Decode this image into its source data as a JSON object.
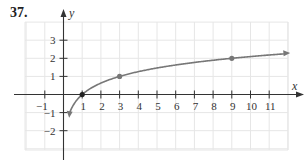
{
  "problem_number": "37.",
  "chart_data": {
    "type": "line",
    "title": "",
    "function_description": "y = log base 3 of x",
    "xlabel": "x",
    "ylabel": "y",
    "xlim": [
      -2,
      12
    ],
    "ylim": [
      -3,
      4
    ],
    "x_ticks": [
      -1,
      1,
      2,
      3,
      4,
      5,
      6,
      7,
      8,
      9,
      10,
      11
    ],
    "x_tick_labels": [
      "−1",
      "1",
      "2",
      "3",
      "4",
      "5",
      "6",
      "7",
      "8",
      "9",
      "10",
      "11"
    ],
    "y_ticks": [
      3,
      2,
      1,
      -1,
      -2
    ],
    "y_tick_labels": [
      "3",
      "2",
      "1",
      "−1",
      "−2"
    ],
    "grid": true,
    "legend": null,
    "series": [
      {
        "name": "curve",
        "color": "#777777",
        "x": [
          0.35,
          0.5,
          0.75,
          1,
          1.5,
          2,
          3,
          4,
          5,
          6,
          7,
          8,
          9,
          10,
          11,
          11.8
        ],
        "values": [
          -0.96,
          -0.63,
          -0.26,
          0,
          0.37,
          0.63,
          1,
          1.26,
          1.46,
          1.63,
          1.77,
          1.89,
          2,
          2.1,
          2.18,
          2.25
        ]
      }
    ],
    "marked_points": [
      {
        "x": 1,
        "y": 0,
        "color": "#222222"
      },
      {
        "x": 3,
        "y": 1,
        "color": "#777777"
      },
      {
        "x": 9,
        "y": 2,
        "color": "#777777"
      }
    ],
    "colors": {
      "axis": "#333333",
      "grid": "#e6e6e6",
      "curve": "#777777"
    }
  }
}
